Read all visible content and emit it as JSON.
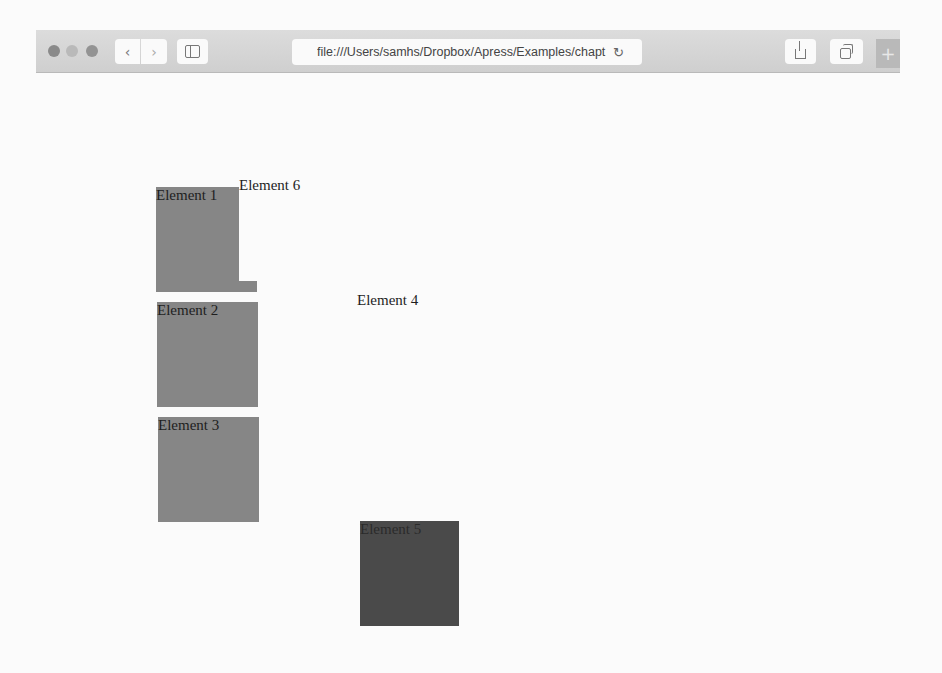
{
  "browser": {
    "window_controls": [
      "close",
      "minimize",
      "zoom"
    ],
    "nav": {
      "back_icon": "‹",
      "forward_icon": "›"
    },
    "address_bar": {
      "url": "file:///Users/samhs/Dropbox/Apress/Examples/chapt",
      "reload_icon": "↻"
    },
    "new_tab_icon": "+"
  },
  "page": {
    "elements": [
      {
        "label": "Element 1",
        "color": "#868686"
      },
      {
        "label": "Element 2",
        "color": "#868686"
      },
      {
        "label": "Element 3",
        "color": "#868686"
      },
      {
        "label": "Element 4",
        "color": "#fbfbfb"
      },
      {
        "label": "Element 5",
        "color": "#4a4a4a"
      },
      {
        "label": "Element 6",
        "color": "#fbfbfb"
      }
    ]
  }
}
